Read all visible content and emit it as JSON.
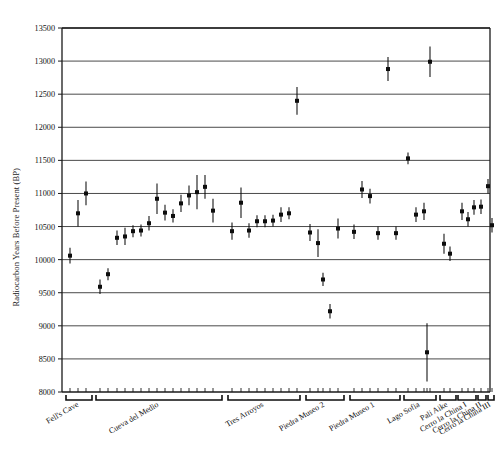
{
  "figure": {
    "ylabel": "Radiocarbon Years Before Present (BP)",
    "plot_area": {
      "x0": 62,
      "x1": 490,
      "y0": 28,
      "y1": 392
    }
  },
  "chart_data": {
    "type": "scatter",
    "title": "",
    "xlabel": "",
    "ylabel": "Radiocarbon Years Before Present (BP)",
    "ylim": [
      8000,
      13500
    ],
    "ytick_step": 500,
    "yticks": [
      8000,
      8500,
      9000,
      9500,
      10000,
      10500,
      11000,
      11500,
      12000,
      12500,
      13000,
      13500
    ],
    "ytick_labels": [
      "8000",
      "8500",
      "9000",
      "9500",
      "10000",
      "10500",
      "11000",
      "11500",
      "12000",
      "12500",
      "13000",
      "13500"
    ],
    "grid": true,
    "legend": null,
    "error_bars": "vertical (1-sigma)",
    "marker": "filled square",
    "groups": [
      {
        "label": "Fell's Cave",
        "bracket": [
          66,
          92
        ],
        "points": [
          {
            "x": 70,
            "y": 10060,
            "err": 120
          },
          {
            "x": 78,
            "y": 10700,
            "err": 200
          },
          {
            "x": 86,
            "y": 11000,
            "err": 180
          }
        ]
      },
      {
        "label": "Cueva del Medio",
        "bracket": [
          96,
          222
        ],
        "points": [
          {
            "x": 100,
            "y": 9590,
            "err": 110
          },
          {
            "x": 108,
            "y": 9780,
            "err": 90
          },
          {
            "x": 117,
            "y": 10330,
            "err": 110
          },
          {
            "x": 125,
            "y": 10350,
            "err": 130
          },
          {
            "x": 133,
            "y": 10430,
            "err": 90
          },
          {
            "x": 141,
            "y": 10440,
            "err": 90
          },
          {
            "x": 149,
            "y": 10550,
            "err": 110
          },
          {
            "x": 157,
            "y": 10920,
            "err": 230
          },
          {
            "x": 165,
            "y": 10710,
            "err": 120
          },
          {
            "x": 173,
            "y": 10660,
            "err": 100
          },
          {
            "x": 181,
            "y": 10850,
            "err": 130
          },
          {
            "x": 189,
            "y": 10970,
            "err": 150
          },
          {
            "x": 197,
            "y": 11020,
            "err": 260
          },
          {
            "x": 205,
            "y": 11100,
            "err": 180
          },
          {
            "x": 213,
            "y": 10740,
            "err": 180
          }
        ]
      },
      {
        "label": "Tres Arroyos",
        "bracket": [
          228,
          300
        ],
        "points": [
          {
            "x": 232,
            "y": 10430,
            "err": 130
          },
          {
            "x": 241,
            "y": 10860,
            "err": 230
          },
          {
            "x": 249,
            "y": 10440,
            "err": 110
          },
          {
            "x": 257,
            "y": 10580,
            "err": 90
          },
          {
            "x": 265,
            "y": 10580,
            "err": 90
          },
          {
            "x": 273,
            "y": 10590,
            "err": 90
          },
          {
            "x": 281,
            "y": 10680,
            "err": 110
          },
          {
            "x": 289,
            "y": 10700,
            "err": 90
          },
          {
            "x": 297,
            "y": 12400,
            "err": 210
          }
        ]
      },
      {
        "label": "Piedra Museo 2",
        "bracket": [
          306,
          344
        ],
        "points": [
          {
            "x": 310,
            "y": 10410,
            "err": 130
          },
          {
            "x": 318,
            "y": 10250,
            "err": 210
          },
          {
            "x": 323,
            "y": 9700,
            "err": 100
          },
          {
            "x": 330,
            "y": 9220,
            "err": 110
          },
          {
            "x": 338,
            "y": 10470,
            "err": 150
          }
        ]
      },
      {
        "label": "Piedra Museo 1",
        "bracket": [
          350,
          400
        ],
        "points": [
          {
            "x": 354,
            "y": 10420,
            "err": 110
          },
          {
            "x": 362,
            "y": 11060,
            "err": 130
          },
          {
            "x": 370,
            "y": 10960,
            "err": 110
          },
          {
            "x": 378,
            "y": 10400,
            "err": 100
          },
          {
            "x": 388,
            "y": 12880,
            "err": 180
          },
          {
            "x": 396,
            "y": 10400,
            "err": 100
          }
        ]
      },
      {
        "label": "Lago Sofia",
        "bracket": [
          404,
          436
        ],
        "points": [
          {
            "x": 408,
            "y": 11530,
            "err": 90
          },
          {
            "x": 416,
            "y": 10680,
            "err": 110
          },
          {
            "x": 424,
            "y": 10730,
            "err": 130
          },
          {
            "x": 430,
            "y": 12990,
            "err": 230
          }
        ]
      },
      {
        "label": "Pali Aike",
        "bracket": [
          440,
          456
        ],
        "points": [
          {
            "x": 444,
            "y": 10240,
            "err": 150
          },
          {
            "x": 450,
            "y": 10090,
            "err": 110
          },
          {
            "x": 427,
            "y": 8600,
            "err": 440
          }
        ]
      },
      {
        "label": "Cerro la China I",
        "bracket": [
          458,
          476
        ],
        "points": [
          {
            "x": 462,
            "y": 10730,
            "err": 130
          },
          {
            "x": 468,
            "y": 10610,
            "err": 110
          },
          {
            "x": 474,
            "y": 10790,
            "err": 110
          }
        ]
      },
      {
        "label": "Cerro la China II",
        "bracket": [
          478,
          486
        ],
        "points": [
          {
            "x": 481,
            "y": 10800,
            "err": 110
          }
        ]
      },
      {
        "label": "Cerro la China III",
        "bracket": [
          488,
          494
        ],
        "points": [
          {
            "x": 488,
            "y": 11110,
            "err": 110
          },
          {
            "x": 492,
            "y": 10520,
            "err": 110
          }
        ]
      }
    ]
  }
}
